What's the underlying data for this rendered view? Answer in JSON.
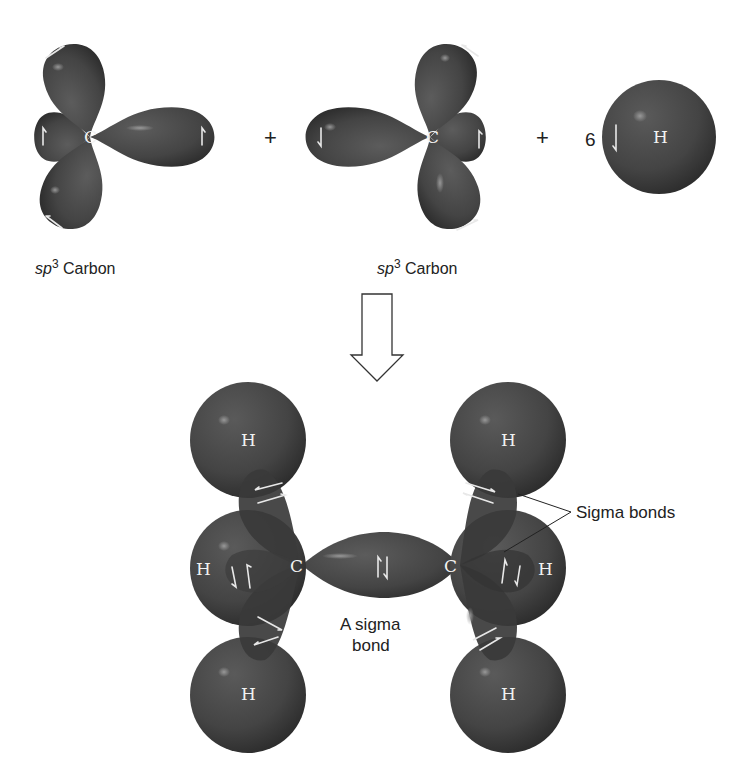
{
  "figure": {
    "colors": {
      "orbital": "#4a4a4a",
      "orbital_dark": "#2e2e2e",
      "highlight": "#8a8a8a",
      "text": "#222222",
      "atom_label": "#f2f2f2",
      "background": "#ffffff"
    }
  },
  "reactants": {
    "carbon_left": {
      "atom_label": "C",
      "caption_italic": "sp",
      "caption_sup": "3",
      "caption_rest": " Carbon"
    },
    "plus_1": "+",
    "carbon_right": {
      "atom_label": "C",
      "caption_italic": "sp",
      "caption_sup": "3",
      "caption_rest": " Carbon"
    },
    "plus_2": "+",
    "hydrogen": {
      "coefficient": "6",
      "atom_label": "H"
    }
  },
  "arrow": {
    "icon": "hollow-down-arrow"
  },
  "product": {
    "left_carbon_label": "C",
    "right_carbon_label": "C",
    "hydrogen_labels": [
      "H",
      "H",
      "H",
      "H",
      "H",
      "H"
    ],
    "cc_bond_label_line1": "A sigma",
    "cc_bond_label_line2": "bond",
    "ch_bond_callout": "Sigma bonds"
  }
}
